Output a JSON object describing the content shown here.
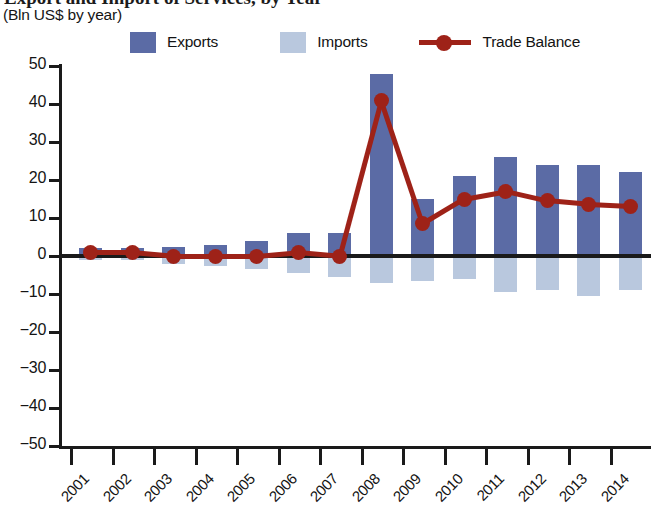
{
  "header": {
    "title_clipped": "Export and Import of Services, by Year",
    "subtitle": "(Bln US$ by year)"
  },
  "legend": {
    "items": [
      {
        "label": "Exports",
        "marker": "square-swatch-dark-blue",
        "color": "#5b6ba5"
      },
      {
        "label": "Imports",
        "marker": "square-swatch-light-blue",
        "color": "#b9c8de"
      },
      {
        "label": "Trade Balance",
        "marker": "line-with-circle-marker",
        "color": "#9e2218"
      }
    ]
  },
  "chart_data": {
    "type": "bar",
    "title": "Export and Import of Services, by Year",
    "subtitle": "(Bln US$ by year)",
    "xlabel": "",
    "ylabel": "",
    "ylim": [
      -50,
      50
    ],
    "yticks": [
      50,
      40,
      30,
      20,
      10,
      0,
      -10,
      -20,
      -30,
      -40,
      -50
    ],
    "ytick_labels": [
      "50",
      "40",
      "30",
      "20",
      "10",
      "0",
      "−10",
      "−20",
      "−30",
      "−40",
      "−50"
    ],
    "categories": [
      "2001",
      "2002",
      "2003",
      "2004",
      "2005",
      "2006",
      "2007",
      "2008",
      "2009",
      "2010",
      "2011",
      "2012",
      "2013",
      "2014"
    ],
    "grid": false,
    "legend_position": "top",
    "series": [
      {
        "name": "Exports",
        "type": "bar",
        "color": "#5b6ba5",
        "values": [
          2,
          2,
          2.5,
          3,
          4,
          6,
          6,
          48,
          15,
          21,
          26,
          24,
          24,
          22
        ]
      },
      {
        "name": "Imports",
        "type": "bar",
        "color": "#b9c8de",
        "values": [
          -1,
          -1,
          -2,
          -2.5,
          -3.5,
          -4.5,
          -5.5,
          -7,
          -6.5,
          -6,
          -9.5,
          -9,
          -10.5,
          -9
        ]
      },
      {
        "name": "Trade Balance",
        "type": "line",
        "color": "#9e2218",
        "values": [
          1,
          1,
          0,
          0,
          0,
          1,
          0,
          41,
          8.5,
          15,
          17,
          14.5,
          13.5,
          13
        ]
      }
    ]
  }
}
